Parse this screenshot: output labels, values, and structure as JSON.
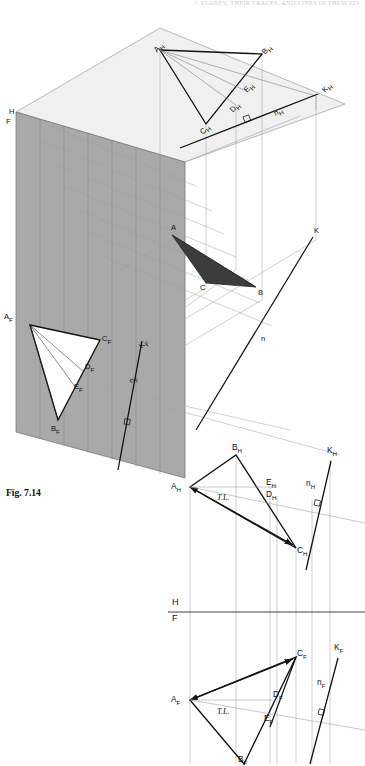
{
  "page": {
    "running_head": "7. PLANES, THEIR TRACES, AND LINES IN THEM   223",
    "caption": "Fig. 7.14",
    "width": 365,
    "height": 764
  },
  "colors": {
    "frontal_plane_fill": "#a9a9a9",
    "horizontal_plane_fill": "#f0f0f0",
    "triangle_shade": "#3c3c3c",
    "line_dark": "#111111",
    "line_light": "#9a9aa2",
    "page_background": "#ffffff",
    "header_text": "#c9c9cf"
  },
  "pictorial": {
    "name": "pictorial-projection-box",
    "plane_labels": [
      {
        "id": "plane-label-h",
        "text": "H",
        "x": 9,
        "y": 112
      },
      {
        "id": "plane-label-f",
        "text": "F",
        "x": 7,
        "y": 121
      }
    ],
    "horizontal_plane_points": [
      {
        "id": "AH",
        "base": "A",
        "sub": "H",
        "x": 155,
        "y": 44
      },
      {
        "id": "BH",
        "base": "B",
        "sub": "H",
        "x": 257,
        "y": 48
      },
      {
        "id": "CH",
        "base": "C",
        "sub": "H",
        "x": 202,
        "y": 118
      },
      {
        "id": "DH",
        "base": "D",
        "sub": "H",
        "x": 232,
        "y": 99
      },
      {
        "id": "EH",
        "base": "E",
        "sub": "H",
        "x": 240,
        "y": 87
      },
      {
        "id": "KH",
        "base": "K",
        "sub": "H",
        "x": 320,
        "y": 88
      },
      {
        "id": "nH",
        "base": "n",
        "sub": "H",
        "x": 276,
        "y": 104
      }
    ],
    "space_points": [
      {
        "id": "A",
        "text": "A",
        "x": 175,
        "y": 227
      },
      {
        "id": "B",
        "text": "B",
        "x": 256,
        "y": 293
      },
      {
        "id": "C",
        "text": "C",
        "x": 203,
        "y": 281
      },
      {
        "id": "K",
        "text": "K",
        "x": 312,
        "y": 230
      },
      {
        "id": "n",
        "text": "n",
        "x": 262,
        "y": 339
      }
    ],
    "frontal_plane_points": [
      {
        "id": "AF",
        "base": "A",
        "sub": "F",
        "x": 6,
        "y": 318
      },
      {
        "id": "BF",
        "base": "B",
        "sub": "F",
        "x": 53,
        "y": 423
      },
      {
        "id": "CF",
        "base": "C",
        "sub": "F",
        "x": 104,
        "y": 338
      },
      {
        "id": "DF",
        "base": "D",
        "sub": "F",
        "x": 88,
        "y": 366
      },
      {
        "id": "EF",
        "base": "E",
        "sub": "F",
        "x": 77,
        "y": 386
      },
      {
        "id": "KF",
        "base": "K",
        "sub": "F",
        "x": 139,
        "y": 348
      },
      {
        "id": "nF",
        "base": "n",
        "sub": "F",
        "x": 129,
        "y": 383
      }
    ]
  },
  "ortho_top_view": {
    "name": "horizontal-projection-view",
    "labels": [
      {
        "id": "BH",
        "base": "B",
        "sub": "H",
        "x": 236,
        "y": 447
      },
      {
        "id": "AH",
        "base": "A",
        "sub": "H",
        "x": 172,
        "y": 483
      },
      {
        "id": "CH",
        "base": "C",
        "sub": "H",
        "x": 290,
        "y": 545
      },
      {
        "id": "EH",
        "base": "E",
        "sub": "H",
        "x": 264,
        "y": 479
      },
      {
        "id": "DH",
        "base": "D",
        "sub": "H",
        "x": 265,
        "y": 491
      },
      {
        "id": "KH",
        "base": "K",
        "sub": "H",
        "x": 326,
        "y": 449
      },
      {
        "id": "nH",
        "base": "n",
        "sub": "H",
        "x": 307,
        "y": 481
      }
    ],
    "true_length_label": "T.L.",
    "true_length_pos": {
      "x": 219,
      "y": 494
    }
  },
  "fold_line": {
    "name": "hf-fold-line",
    "upper_label": "H",
    "lower_label": "F",
    "y": 612,
    "upper_label_pos": {
      "x": 173,
      "y": 598
    },
    "lower_label_pos": {
      "x": 173,
      "y": 614
    }
  },
  "ortho_front_view": {
    "name": "frontal-projection-view",
    "labels": [
      {
        "id": "CF",
        "base": "C",
        "sub": "F",
        "x": 295,
        "y": 650
      },
      {
        "id": "AF",
        "base": "A",
        "sub": "F",
        "x": 172,
        "y": 696
      },
      {
        "id": "DF",
        "base": "D",
        "sub": "F",
        "x": 273,
        "y": 691
      },
      {
        "id": "EF",
        "base": "E",
        "sub": "F",
        "x": 264,
        "y": 716
      },
      {
        "id": "KF",
        "base": "K",
        "sub": "F",
        "x": 333,
        "y": 646
      },
      {
        "id": "nF",
        "base": "n",
        "sub": "F",
        "x": 318,
        "y": 681
      },
      {
        "id": "BF",
        "base": "B",
        "sub": "F",
        "x": 237,
        "y": 756
      }
    ],
    "true_length_label": "T.L.",
    "true_length_pos": {
      "x": 219,
      "y": 709
    }
  }
}
